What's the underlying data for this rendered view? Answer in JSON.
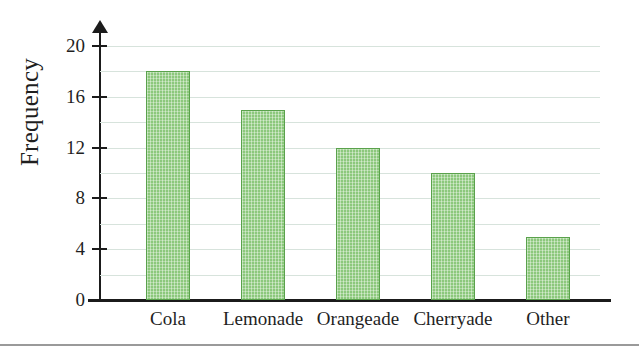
{
  "chart_data": {
    "type": "bar",
    "title": "",
    "subtitle": "",
    "xlabel": "",
    "ylabel": "Frequency",
    "categories": [
      "Cola",
      "Lemonade",
      "Orangeade",
      "Cherryade",
      "Other"
    ],
    "values": [
      18,
      15,
      12,
      10,
      5
    ],
    "ylim": [
      0,
      20
    ],
    "y_tick_labels": [
      "0",
      "4",
      "8",
      "12",
      "16",
      "20"
    ],
    "y_tick_values": [
      0,
      4,
      8,
      12,
      16,
      20
    ],
    "gridlines": {
      "enabled": true,
      "axis": "y",
      "values": [
        2,
        4,
        6,
        8,
        10,
        12,
        14,
        16,
        18,
        20
      ],
      "color": "#d7e3dc"
    },
    "legend": {
      "visible": false,
      "position": "none"
    },
    "annotations": [],
    "colors": {
      "bar_fill": "#8cc87c",
      "bar_border": "#5aa24c",
      "axis": "#1b1b1b",
      "grid": "#d7e3dc",
      "text": "#1f1f1f",
      "rule": "#9a9a9a",
      "background": "#ffffff"
    },
    "axis_style": {
      "y_axis_arrow": true,
      "x_axis_arrow": false,
      "y_ticks_visible": true
    }
  }
}
